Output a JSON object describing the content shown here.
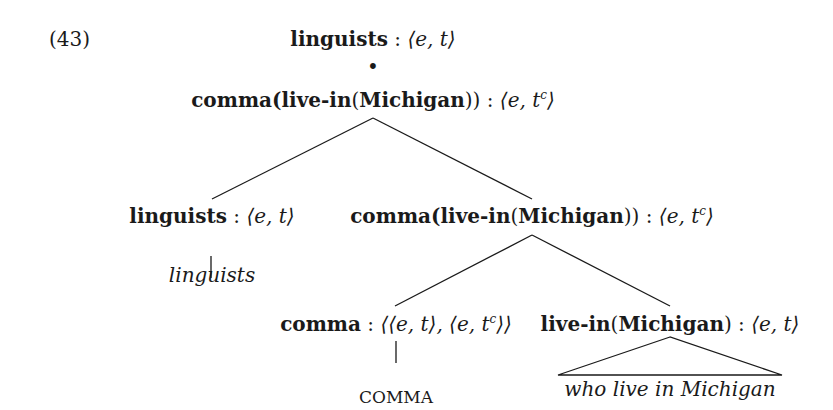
{
  "example_number": "(43)",
  "tree": {
    "root": {
      "term": "linguists",
      "sep": " : ",
      "type": "⟨e, t⟩"
    },
    "bullet": "•",
    "node1": {
      "term_pre": "comma(",
      "term_b1": "live-in",
      "term_mid": "(",
      "term_b2": "Michigan",
      "term_post": "))",
      "sep": " : ",
      "type_pre": "⟨e, t",
      "type_sup": "c",
      "type_post": "⟩"
    },
    "left": {
      "term": "linguists",
      "sep": " : ",
      "type": "⟨e, t⟩",
      "leaf": "linguists"
    },
    "right": {
      "term_pre": "comma(",
      "term_b1": "live-in",
      "term_mid": "(",
      "term_b2": "Michigan",
      "term_post": "))",
      "sep": " : ",
      "type_pre": "⟨e, t",
      "type_sup": "c",
      "type_post": "⟩"
    },
    "comma_node": {
      "term": "comma",
      "sep": " : ",
      "type_pre": "⟨⟨e, t⟩, ⟨e, t",
      "type_sup": "c",
      "type_post": "⟩⟩",
      "leaf": "COMMA"
    },
    "livein_node": {
      "term_b1": "live-in",
      "term_mid": "(",
      "term_b2": "Michigan",
      "term_post": ")",
      "sep": " : ",
      "type": "⟨e, t⟩",
      "leaf": "who live in Michigan"
    }
  }
}
